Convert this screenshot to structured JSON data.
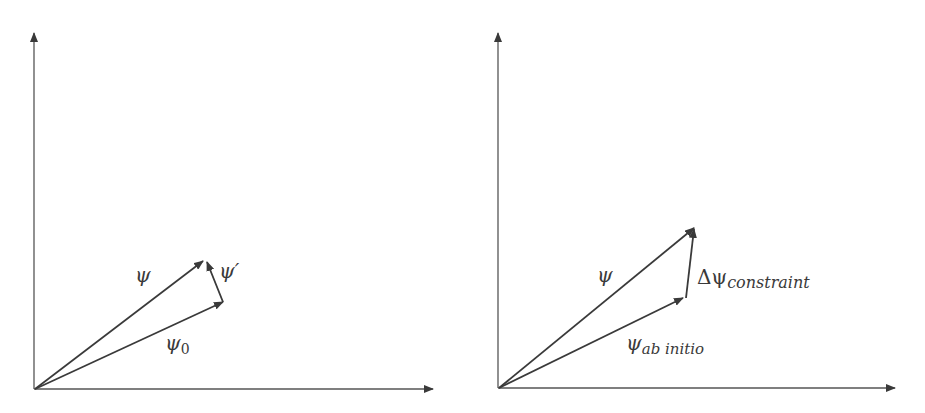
{
  "panels": [
    {
      "id": "left",
      "vectors": [
        {
          "name": "psi",
          "label": "ψ"
        },
        {
          "name": "psi0",
          "label": "ψ",
          "subscript": "0"
        },
        {
          "name": "psi-prime",
          "label": "ψ′"
        }
      ]
    },
    {
      "id": "right",
      "vectors": [
        {
          "name": "psi",
          "label": "ψ"
        },
        {
          "name": "psi-ab-initio",
          "label": "ψ",
          "subscript": "ab initio"
        },
        {
          "name": "delta-psi-constraint",
          "label": "Δψ",
          "subscript": "constraint"
        }
      ]
    }
  ],
  "colors": {
    "line": "#3a3a3a",
    "background": "#ffffff"
  }
}
